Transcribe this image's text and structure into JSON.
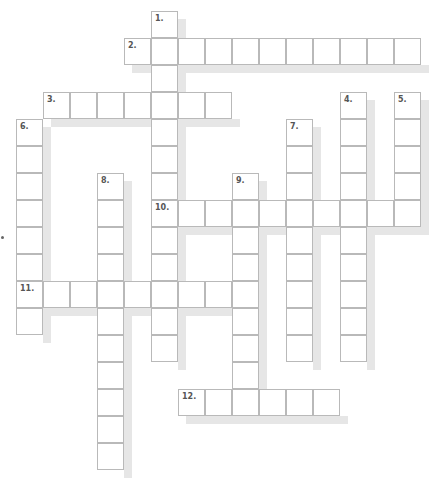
{
  "puzzle": {
    "cell_size": 27,
    "origin_x": 16,
    "origin_y": 11,
    "border_color": "#b9b9b9",
    "shadow_color": "#e6e6e6",
    "words": [
      {
        "number": "1.",
        "dir": "down",
        "col": 5,
        "row": 0,
        "length": 13
      },
      {
        "number": "2.",
        "dir": "across",
        "col": 4,
        "row": 1,
        "length": 11
      },
      {
        "number": "3.",
        "dir": "across",
        "col": 1,
        "row": 3,
        "length": 7
      },
      {
        "number": "4.",
        "dir": "down",
        "col": 12,
        "row": 3,
        "length": 10
      },
      {
        "number": "5.",
        "dir": "down",
        "col": 14,
        "row": 3,
        "length": 5
      },
      {
        "number": "6.",
        "dir": "down",
        "col": 0,
        "row": 4,
        "length": 8
      },
      {
        "number": "7.",
        "dir": "down",
        "col": 10,
        "row": 4,
        "length": 9
      },
      {
        "number": "8.",
        "dir": "down",
        "col": 3,
        "row": 6,
        "length": 11
      },
      {
        "number": "9.",
        "dir": "down",
        "col": 8,
        "row": 6,
        "length": 8
      },
      {
        "number": "10.",
        "dir": "across",
        "col": 5,
        "row": 7,
        "length": 10
      },
      {
        "number": "11.",
        "dir": "across",
        "col": 0,
        "row": 10,
        "length": 9
      },
      {
        "number": "12.",
        "dir": "across",
        "col": 6,
        "row": 14,
        "length": 6
      }
    ]
  }
}
